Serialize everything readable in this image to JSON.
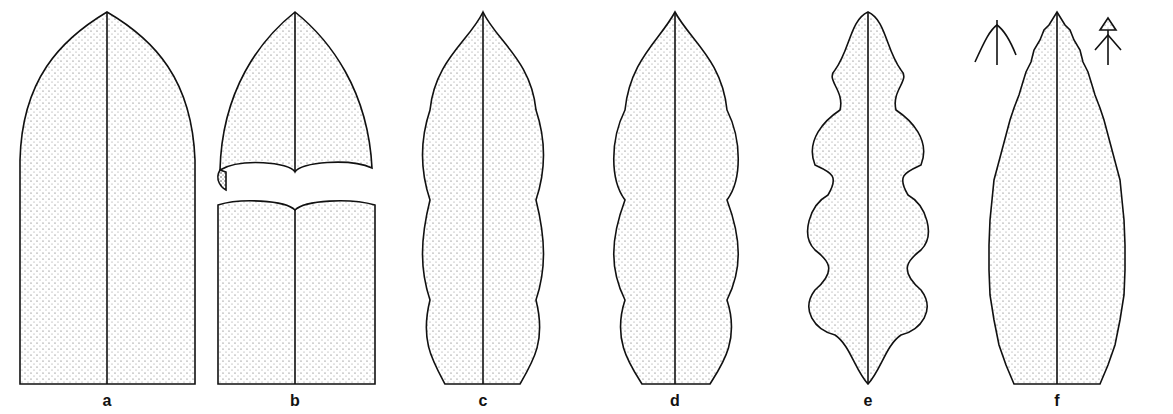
{
  "figure": {
    "panels": [
      {
        "label": "a",
        "x": 107
      },
      {
        "label": "b",
        "x": 295
      },
      {
        "label": "c",
        "x": 483
      },
      {
        "label": "d",
        "x": 675
      },
      {
        "label": "e",
        "x": 868
      },
      {
        "label": "f",
        "x": 1057
      }
    ]
  }
}
